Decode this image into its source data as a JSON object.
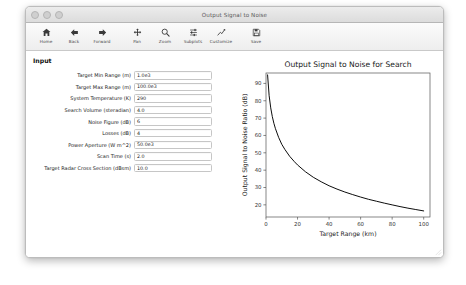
{
  "window": {
    "title": "Output Signal to Noise",
    "traffic_lights": [
      "close-button",
      "minimize-button",
      "zoom-button"
    ]
  },
  "toolbar": {
    "buttons": [
      {
        "name": "home-button",
        "label": "Home",
        "icon": "home-icon"
      },
      {
        "name": "back-button",
        "label": "Back",
        "icon": "arrow-left-icon"
      },
      {
        "name": "forward-button",
        "label": "Forward",
        "icon": "arrow-right-icon"
      },
      {
        "name": "pan-button",
        "label": "Pan",
        "icon": "move-cross-icon"
      },
      {
        "name": "zoom-button",
        "label": "Zoom",
        "icon": "magnifier-icon"
      },
      {
        "name": "subplots-button",
        "label": "Subplots",
        "icon": "sliders-icon"
      },
      {
        "name": "customize-button",
        "label": "Customize",
        "icon": "line-chart-icon"
      },
      {
        "name": "save-button",
        "label": "Save",
        "icon": "floppy-disk-icon"
      }
    ]
  },
  "input_panel": {
    "heading": "Input",
    "fields": [
      {
        "name": "target-min-range-field",
        "label": "Target Min Range (m)",
        "value": "1.0e3"
      },
      {
        "name": "target-max-range-field",
        "label": "Target Max Range (m)",
        "value": "100.0e3"
      },
      {
        "name": "system-temperature-field",
        "label": "System Temperature (K)",
        "value": "290"
      },
      {
        "name": "search-volume-field",
        "label": "Search Volume (steradian)",
        "value": "4.0"
      },
      {
        "name": "noise-figure-field",
        "label": "Noise Figure (dB)",
        "value": "6"
      },
      {
        "name": "losses-field",
        "label": "Losses (dB)",
        "value": "4"
      },
      {
        "name": "power-aperture-field",
        "label": "Power Aperture (W m^2)",
        "value": "50.0e3"
      },
      {
        "name": "scan-time-field",
        "label": "Scan Time (s)",
        "value": "2.0"
      },
      {
        "name": "target-rcs-field",
        "label": "Target Radar Cross Section (dBsm)",
        "value": "10.0"
      }
    ]
  },
  "chart_data": {
    "type": "line",
    "title": "Output Signal to Noise for Search",
    "xlabel": "Target Range (km)",
    "ylabel": "Output Signal to Noise Ratio (dB)",
    "xlim": [
      0,
      104
    ],
    "ylim": [
      13,
      96
    ],
    "xticks": [
      0,
      20,
      40,
      60,
      80,
      100
    ],
    "yticks": [
      20,
      30,
      40,
      50,
      60,
      70,
      80,
      90
    ],
    "grid": false,
    "legend": null,
    "line_color": "#000000",
    "series": [
      {
        "name": "Search SNR",
        "x": [
          1,
          2,
          3,
          4,
          5,
          6,
          8,
          10,
          12,
          15,
          18,
          20,
          25,
          30,
          35,
          40,
          45,
          50,
          55,
          60,
          65,
          70,
          75,
          80,
          85,
          90,
          95,
          100
        ],
        "y": [
          94.9,
          82.9,
          75.9,
          70.9,
          67.0,
          63.9,
          58.9,
          54.9,
          51.9,
          48.0,
          44.9,
          43.0,
          39.1,
          35.9,
          33.3,
          31.0,
          29.1,
          27.4,
          25.9,
          24.5,
          23.2,
          22.1,
          21.0,
          20.0,
          19.0,
          18.1,
          17.3,
          16.5
        ]
      }
    ]
  }
}
